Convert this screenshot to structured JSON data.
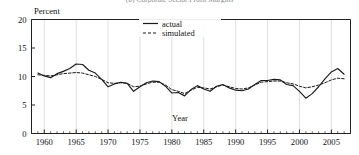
{
  "figure": {
    "title": "(b) Corporate Sector Profit Margins",
    "title_visible_fragment": "(b) Corporate Sector Profit Margins"
  },
  "axes": {
    "ylabel": "Percent",
    "xlabel": "Year",
    "y_ticks": [
      "0",
      "5",
      "10",
      "15",
      "20"
    ],
    "x_ticks": [
      "1960",
      "1965",
      "1970",
      "1975",
      "1980",
      "1985",
      "1990",
      "1995",
      "2000",
      "2005"
    ]
  },
  "legend": {
    "items": [
      {
        "label": "actual",
        "style": "solid",
        "color": "#1a1a1a"
      },
      {
        "label": "simulated",
        "style": "dashed",
        "color": "#1a1a1a"
      }
    ]
  },
  "chart_data": {
    "type": "line",
    "title": "(b) Corporate Sector Profit Margins",
    "xlabel": "Year",
    "ylabel": "Percent",
    "xlim": [
      1958,
      2008
    ],
    "ylim": [
      0,
      20
    ],
    "grid": true,
    "grid_axis": "x",
    "legend_position": "top-center",
    "x": [
      1959,
      1960,
      1961,
      1962,
      1963,
      1964,
      1965,
      1966,
      1967,
      1968,
      1969,
      1970,
      1971,
      1972,
      1973,
      1974,
      1975,
      1976,
      1977,
      1978,
      1979,
      1980,
      1981,
      1982,
      1983,
      1984,
      1985,
      1986,
      1987,
      1988,
      1989,
      1990,
      1991,
      1992,
      1993,
      1994,
      1995,
      1996,
      1997,
      1998,
      1999,
      2000,
      2001,
      2002,
      2003,
      2004,
      2005,
      2006,
      2007
    ],
    "series": [
      {
        "name": "actual",
        "style": "solid",
        "values": [
          10.6,
          10.1,
          9.8,
          10.5,
          10.9,
          11.4,
          12.2,
          12.1,
          11.1,
          10.6,
          9.5,
          8.2,
          8.7,
          9.0,
          8.8,
          7.4,
          8.2,
          8.9,
          9.2,
          9.1,
          8.3,
          7.1,
          7.2,
          6.6,
          7.7,
          8.4,
          7.8,
          7.4,
          8.3,
          8.6,
          8.0,
          7.6,
          7.5,
          7.8,
          8.6,
          9.3,
          9.3,
          9.5,
          9.4,
          8.6,
          8.4,
          7.4,
          6.2,
          7.0,
          8.2,
          9.6,
          10.8,
          11.4,
          10.4
        ]
      },
      {
        "name": "simulated",
        "style": "dashed",
        "values": [
          10.3,
          10.2,
          10.1,
          10.3,
          10.5,
          10.6,
          10.7,
          10.6,
          10.3,
          10.0,
          9.5,
          8.9,
          8.8,
          8.9,
          8.8,
          8.2,
          8.3,
          8.7,
          9.0,
          9.0,
          8.5,
          7.7,
          7.4,
          7.0,
          7.6,
          8.1,
          8.0,
          7.8,
          8.2,
          8.5,
          8.2,
          7.9,
          7.8,
          8.0,
          8.5,
          9.0,
          9.1,
          9.2,
          9.2,
          8.9,
          8.7,
          8.3,
          8.0,
          8.2,
          8.5,
          8.9,
          9.4,
          9.7,
          9.6
        ]
      }
    ]
  }
}
